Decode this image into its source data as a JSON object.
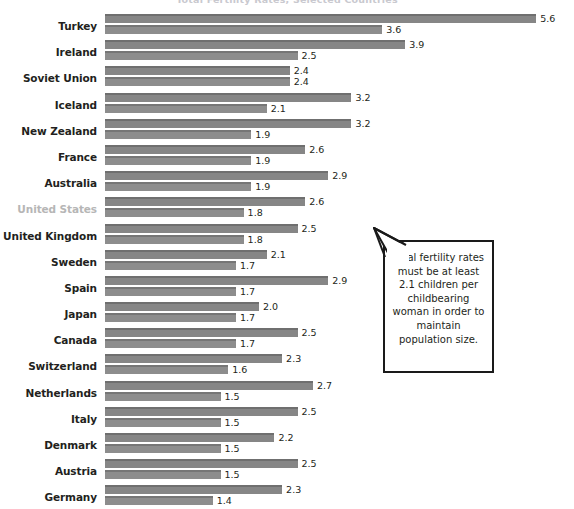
{
  "chart_data": {
    "type": "bar",
    "title": "",
    "xlabel": "",
    "ylabel": "",
    "orientation": "horizontal",
    "grid": false,
    "legend_position": "none",
    "xlim": [
      0,
      5.8
    ],
    "categories": [
      "Turkey",
      "Ireland",
      "Soviet Union",
      "Iceland",
      "New Zealand",
      "France",
      "Australia",
      "United States",
      "United Kingdom",
      "Sweden",
      "Spain",
      "Japan",
      "Canada",
      "Switzerland",
      "Netherlands",
      "Italy",
      "Denmark",
      "Austria",
      "Germany"
    ],
    "series": [
      {
        "name": "earlier",
        "values": [
          5.6,
          3.9,
          2.4,
          3.2,
          3.2,
          2.6,
          2.9,
          2.6,
          2.5,
          2.1,
          2.9,
          2.0,
          2.5,
          2.3,
          2.7,
          2.5,
          2.2,
          2.5,
          2.3
        ]
      },
      {
        "name": "later",
        "values": [
          3.6,
          2.5,
          2.4,
          2.1,
          1.9,
          1.9,
          1.9,
          1.8,
          1.8,
          1.7,
          1.7,
          1.7,
          1.7,
          1.6,
          1.5,
          1.5,
          1.5,
          1.5,
          1.4
        ]
      }
    ],
    "value_labels": [
      [
        "5.6",
        "3.6"
      ],
      [
        "3.9",
        "2.5"
      ],
      [
        "2.4",
        "2.4"
      ],
      [
        "3.2",
        "2.1"
      ],
      [
        "3.2",
        "1.9"
      ],
      [
        "2.6",
        "1.9"
      ],
      [
        "2.9",
        "1.9"
      ],
      [
        "2.6",
        "1.8"
      ],
      [
        "2.5",
        "1.8"
      ],
      [
        "2.1",
        "1.7"
      ],
      [
        "2.9",
        "1.7"
      ],
      [
        "2.0",
        "1.7"
      ],
      [
        "2.5",
        "1.7"
      ],
      [
        "2.3",
        "1.6"
      ],
      [
        "2.7",
        "1.5"
      ],
      [
        "2.5",
        "1.5"
      ],
      [
        "2.2",
        "1.5"
      ],
      [
        "2.5",
        "1.5"
      ],
      [
        "2.3",
        "1.4"
      ]
    ],
    "highlighted_category": "United States",
    "annotations": [
      "Total fertility rates must be at least 2.1 children per childbearing woman in order to maintain population size."
    ],
    "colors": {
      "bar_series_1": "#868686",
      "bar_series_1_edge": "#6f6f6f",
      "bar_series_2": "#8d8d8d",
      "bar_series_2_edge": "#767676",
      "label_text": "#231f20",
      "label_highlighted": "#b6b6b6",
      "callout_border": "#1a1a1a",
      "background": "#ffffff"
    }
  },
  "callout": {
    "text": "Total fertility rates must be at least 2.1 children per childbearing woman in order to maintain population size."
  },
  "title_strip": {
    "text": "Total Fertility Rates, Selected Countries"
  }
}
